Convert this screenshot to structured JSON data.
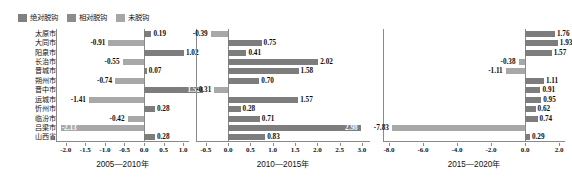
{
  "legend": {
    "items": [
      {
        "label": "绝对脱钩",
        "color": "#808080",
        "name": "absolute-decoupling"
      },
      {
        "label": "相对脱钩",
        "color": "#8c8c8c",
        "name": "relative-decoupling"
      },
      {
        "label": "未脱钩",
        "color": "#a6a6a6",
        "name": "not-decoupled"
      }
    ]
  },
  "categories": [
    "太原市",
    "大同市",
    "阳泉市",
    "长治市",
    "晋城市",
    "朔州市",
    "晋中市",
    "运城市",
    "忻州市",
    "临汾市",
    "吕梁市",
    "山西省"
  ],
  "colors": {
    "bar_dark": "#7d7d7d",
    "bar_mid": "#8f8f8f",
    "bar_light": "#a8a8a8",
    "axis": "#8a8a8a",
    "text": "#111111"
  },
  "chart_data": [
    {
      "type": "bar",
      "orientation": "horizontal",
      "title": "2005—2010年",
      "xlabel": "",
      "ylabel": "",
      "xlim": [
        -2.25,
        1.15
      ],
      "xticks": [
        -2.0,
        -1.5,
        -1.0,
        -0.5,
        0.0,
        0.5,
        1.0
      ],
      "xticklabels": [
        "-2.0",
        "-1.5",
        "-1.0",
        "-0.5",
        "0.0",
        "0.5",
        "1.0"
      ],
      "grid": false,
      "legend_position": "top-left",
      "categories": [
        "太原市",
        "大同市",
        "阳泉市",
        "长治市",
        "晋城市",
        "朔州市",
        "晋中市",
        "运城市",
        "忻州市",
        "临汾市",
        "吕梁市",
        "山西省"
      ],
      "values": [
        0.19,
        -0.91,
        1.02,
        -0.55,
        0.07,
        -0.74,
        1.52,
        -1.41,
        0.28,
        -0.42,
        -2.13,
        0.28
      ],
      "labels": [
        "0.19",
        "-0.91",
        "1.02",
        "-0.55",
        "0.07",
        "-0.74",
        "1.52",
        "-1.41",
        "0.28",
        "-0.42",
        "-2.13",
        "0.28"
      ],
      "label_inside": [
        false,
        false,
        false,
        false,
        false,
        false,
        true,
        false,
        false,
        false,
        true,
        false
      ]
    },
    {
      "type": "bar",
      "orientation": "horizontal",
      "title": "2010—2015年",
      "xlabel": "",
      "ylabel": "",
      "xlim": [
        -0.72,
        3.18
      ],
      "xticks": [
        -0.5,
        0.0,
        0.5,
        1.0,
        1.5,
        2.0,
        2.5,
        3.0
      ],
      "xticklabels": [
        "-0.5",
        "0.0",
        "0.5",
        "1.0",
        "1.5",
        "2.0",
        "2.5",
        "3.0"
      ],
      "grid": false,
      "legend_position": "none",
      "categories": [
        "太原市",
        "大同市",
        "阳泉市",
        "长治市",
        "晋城市",
        "朔州市",
        "晋中市",
        "运城市",
        "忻州市",
        "临汾市",
        "吕梁市",
        "山西省"
      ],
      "values": [
        -0.39,
        0.75,
        0.41,
        2.02,
        1.58,
        0.7,
        -0.31,
        1.57,
        0.28,
        0.71,
        2.98,
        0.83
      ],
      "labels": [
        "-0.39",
        "0.75",
        "0.41",
        "2.02",
        "1.58",
        "0.70",
        "-0.31",
        "1.57",
        "0.28",
        "0.71",
        "2.98",
        "0.83"
      ],
      "label_inside": [
        false,
        false,
        false,
        false,
        false,
        false,
        false,
        false,
        false,
        false,
        true,
        false
      ]
    },
    {
      "type": "bar",
      "orientation": "horizontal",
      "title": "2015—2020年",
      "xlabel": "",
      "ylabel": "",
      "xlim": [
        -8.35,
        2.35
      ],
      "xticks": [
        -8.0,
        -6.0,
        -4.0,
        -2.0,
        0.0,
        2.0
      ],
      "xticklabels": [
        "-8.0",
        "-6.0",
        "-4.0",
        "-2.0",
        "0.0",
        "2.0"
      ],
      "grid": false,
      "legend_position": "none",
      "categories": [
        "太原市",
        "大同市",
        "阳泉市",
        "长治市",
        "晋城市",
        "朔州市",
        "晋中市",
        "运城市",
        "忻州市",
        "临汾市",
        "吕梁市",
        "山西省"
      ],
      "values": [
        1.76,
        1.93,
        1.57,
        -0.38,
        -1.11,
        1.11,
        0.91,
        0.95,
        0.62,
        0.74,
        -7.83,
        0.29
      ],
      "labels": [
        "1.76",
        "1.93",
        "1.57",
        "-0.38",
        "-1.11",
        "1.11",
        "0.91",
        "0.95",
        "0.62",
        "0.74",
        "-7.83",
        "0.29"
      ],
      "label_inside": [
        false,
        false,
        false,
        false,
        false,
        false,
        false,
        false,
        false,
        false,
        false,
        false
      ]
    }
  ],
  "panel_layout": [
    {
      "left": 56,
      "width": 133
    },
    {
      "left": 196,
      "width": 174
    },
    {
      "left": 383,
      "width": 182
    }
  ]
}
